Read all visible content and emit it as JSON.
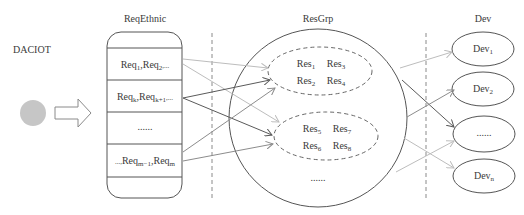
{
  "title": "DACIOT",
  "columns": {
    "req": {
      "label": "ReqEthnic"
    },
    "res": {
      "label": "ResGrp"
    },
    "dev": {
      "label": "Dev"
    }
  },
  "source": {
    "shape": "filled-circle",
    "color": "#c6c6c6",
    "arrow": "hollow-right-arrow"
  },
  "req_rows": [
    {
      "base": "Req",
      "parts": [
        [
          "Req",
          "1"
        ],
        [
          ",Req",
          "2"
        ],
        [
          ",...",
          ""
        ]
      ]
    },
    {
      "base": "Req",
      "parts": [
        [
          "Req",
          "k"
        ],
        [
          ",Req",
          "k+1"
        ],
        [
          ",...",
          ""
        ]
      ]
    },
    {
      "text": "......"
    },
    {
      "parts": [
        [
          "...,",
          ""
        ],
        [
          "Req",
          "m−1"
        ],
        [
          ",Req",
          "m"
        ]
      ]
    }
  ],
  "res_groups": [
    {
      "items": [
        [
          "Res",
          "1"
        ],
        [
          "Res",
          "3"
        ],
        [
          "Res",
          "2"
        ],
        [
          "Res",
          "4"
        ]
      ]
    },
    {
      "items": [
        [
          "Res",
          "5"
        ],
        [
          "Res",
          "7"
        ],
        [
          "Res",
          "6"
        ],
        [
          "Res",
          "8"
        ]
      ]
    }
  ],
  "res_more": "......",
  "devices": [
    {
      "base": "Dev",
      "sub": "1"
    },
    {
      "base": "Dev",
      "sub": "2"
    },
    {
      "text": "......"
    },
    {
      "base": "Dev",
      "sub": "n"
    }
  ],
  "colors": {
    "outline": "#555555",
    "arrow_dark": "#5a5a5a",
    "arrow_mid": "#8c8c8c",
    "arrow_light": "#bdbdbd",
    "divider": "#8a8a8a"
  },
  "edges_req_to_res": [
    {
      "from": [
        183,
        59
      ],
      "to": [
        268,
        68
      ],
      "tone": "light"
    },
    {
      "from": [
        183,
        64
      ],
      "to": [
        279,
        122
      ],
      "tone": "light"
    },
    {
      "from": [
        183,
        98
      ],
      "to": [
        270,
        80
      ],
      "tone": "dark"
    },
    {
      "from": [
        183,
        98
      ],
      "to": [
        272,
        135
      ],
      "tone": "dark"
    },
    {
      "from": [
        183,
        152
      ],
      "to": [
        275,
        88
      ],
      "tone": "mid"
    },
    {
      "from": [
        183,
        161
      ],
      "to": [
        273,
        144
      ],
      "tone": "mid"
    }
  ],
  "edges_res_to_dev": [
    {
      "from": [
        400,
        68
      ],
      "to": [
        452,
        52
      ],
      "tone": "light"
    },
    {
      "from": [
        402,
        80
      ],
      "to": [
        454,
        127
      ],
      "tone": "dark"
    },
    {
      "from": [
        407,
        117
      ],
      "to": [
        454,
        90
      ],
      "tone": "mid"
    },
    {
      "from": [
        404,
        138
      ],
      "to": [
        454,
        168
      ],
      "tone": "light"
    },
    {
      "from": [
        396,
        172
      ],
      "to": [
        454,
        141
      ],
      "tone": "light"
    }
  ]
}
